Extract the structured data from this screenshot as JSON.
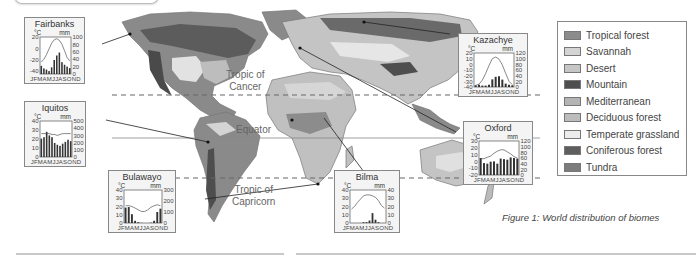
{
  "figure": {
    "caption": "Figure 1: World distribution of biomes"
  },
  "map_labels": {
    "tropic_cancer": "Tropic of\nCancer",
    "equator": "Equator",
    "tropic_capricorn": "Tropic of\nCapricorn"
  },
  "legend": {
    "items": [
      {
        "label": "Tropical forest",
        "color": "#8c8c8c"
      },
      {
        "label": "Savannah",
        "color": "#d4d4d4"
      },
      {
        "label": "Desert",
        "color": "#c6c6c6"
      },
      {
        "label": "Mountain",
        "color": "#4e4e4e"
      },
      {
        "label": "Mediterranean",
        "color": "#b4b4b4"
      },
      {
        "label": "Deciduous forest",
        "color": "#bcbcbc"
      },
      {
        "label": "Temperate grassland",
        "color": "#ececec"
      },
      {
        "label": "Coniferous forest",
        "color": "#5e5e5e"
      },
      {
        "label": "Tundra",
        "color": "#7c7c7c"
      }
    ]
  },
  "colors": {
    "ocean": "#ffffff",
    "land_base": "#b9b9b9",
    "outline": "#777777",
    "bar": "#333333",
    "temp_line": "#555555"
  },
  "chart_data": [
    {
      "type": "bar+line",
      "title": "Fairbanks",
      "left_unit": "°C",
      "right_unit": "mm",
      "left_ticks": [
        20,
        0,
        -20,
        -40
      ],
      "right_ticks": [
        100,
        80,
        60,
        40,
        20,
        0
      ],
      "ylim_temp": [
        -45,
        20
      ],
      "ylim_precip": [
        0,
        100
      ],
      "months": "JFMAMJJASOND",
      "precip_mm": [
        22,
        15,
        12,
        8,
        18,
        38,
        50,
        58,
        32,
        25,
        20,
        16
      ],
      "temp_c": [
        -24,
        -19,
        -11,
        -1,
        9,
        15,
        17,
        14,
        7,
        -4,
        -16,
        -22
      ]
    },
    {
      "type": "bar+line",
      "title": "Iquitos",
      "left_unit": "°C",
      "right_unit": "mm",
      "left_ticks": [
        40,
        30,
        20,
        10,
        0
      ],
      "right_ticks": [
        500,
        400,
        300,
        200,
        100,
        0
      ],
      "ylim_temp": [
        0,
        40
      ],
      "ylim_precip": [
        0,
        500
      ],
      "months": "JFMAMJJASOND",
      "precip_mm": [
        255,
        275,
        350,
        300,
        275,
        195,
        170,
        155,
        185,
        210,
        240,
        220
      ],
      "temp_c": [
        26,
        26,
        26,
        26,
        25,
        25,
        24,
        25,
        26,
        26,
        26,
        26
      ]
    },
    {
      "type": "bar+line",
      "title": "Kazachye",
      "left_unit": "°C",
      "right_unit": "mm",
      "left_ticks": [
        20,
        10,
        0,
        -10,
        -20,
        -30,
        -40
      ],
      "right_ticks": [
        120,
        100,
        80,
        60,
        40,
        20,
        0
      ],
      "ylim_temp": [
        -40,
        20
      ],
      "ylim_precip": [
        0,
        120
      ],
      "months": "JFMAMJJASOND",
      "precip_mm": [
        6,
        8,
        5,
        5,
        8,
        27,
        36,
        38,
        26,
        12,
        8,
        6
      ],
      "temp_c": [
        -37,
        -35,
        -28,
        -16,
        -2,
        10,
        13,
        9,
        -1,
        -16,
        -30,
        -36
      ]
    },
    {
      "type": "bar+line",
      "title": "Oxford",
      "left_unit": "°C",
      "right_unit": "mm",
      "left_ticks": [
        30,
        20,
        10,
        0,
        -10,
        -20
      ],
      "right_ticks": [
        120,
        100,
        80,
        60,
        40,
        20,
        0
      ],
      "ylim_temp": [
        -20,
        30
      ],
      "ylim_precip": [
        0,
        120
      ],
      "months": "JFMAMJJASOND",
      "precip_mm": [
        60,
        42,
        40,
        47,
        48,
        40,
        58,
        56,
        54,
        62,
        60,
        58
      ],
      "temp_c": [
        4,
        4,
        6,
        8,
        12,
        15,
        17,
        17,
        14,
        11,
        7,
        5
      ]
    },
    {
      "type": "bar+line",
      "title": "Bulawayo",
      "left_unit": "°C",
      "right_unit": "mm",
      "left_ticks": [
        40,
        30,
        20,
        10,
        0
      ],
      "right_ticks": [
        300,
        200,
        100,
        0
      ],
      "ylim_temp": [
        0,
        40
      ],
      "ylim_precip": [
        0,
        300
      ],
      "months": "JFMAMJJASOND",
      "precip_mm": [
        140,
        145,
        80,
        20,
        8,
        2,
        0,
        0,
        3,
        20,
        100,
        130
      ],
      "temp_c": [
        21,
        21,
        20,
        18,
        16,
        14,
        14,
        16,
        19,
        21,
        22,
        21
      ]
    },
    {
      "type": "bar+line",
      "title": "Bilma",
      "left_unit": "°C",
      "right_unit": "mm",
      "left_ticks": [
        40,
        30,
        20,
        10,
        0
      ],
      "right_ticks": [
        40,
        30,
        20,
        10,
        0
      ],
      "ylim_temp": [
        0,
        40
      ],
      "ylim_precip": [
        0,
        40
      ],
      "months": "JFMAMJJASOND",
      "precip_mm": [
        0,
        0,
        0,
        0,
        1,
        1,
        3,
        12,
        4,
        1,
        0,
        0
      ],
      "temp_c": [
        17,
        20,
        25,
        29,
        33,
        34,
        34,
        33,
        31,
        27,
        21,
        18
      ]
    }
  ]
}
